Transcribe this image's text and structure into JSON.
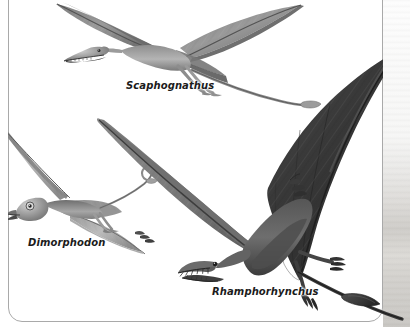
{
  "page": {
    "background_color": "#ffffff",
    "width": 410,
    "height": 327
  },
  "card": {
    "name": "illustration-card",
    "background_color": "#ffffff",
    "border_color": "#a9a9a9",
    "corner_radius_px": 14
  },
  "illustration": {
    "style": "grayscale pencil / airbrush paleoart",
    "subject": "three Jurassic rhamphorhynchoid pterosaurs in flight",
    "ink_colors": {
      "darkest": "#2b2b2b",
      "dark": "#4a4a4a",
      "mid": "#777777",
      "light": "#a8a8a8",
      "lightest": "#d5d5d5"
    },
    "figures": [
      {
        "id": "scaphognathus",
        "label": "Scaphognathus",
        "position": "upper center",
        "relative_size": "medium",
        "tone": "medium gray",
        "traits": "long narrow wings swept back, elongated tail with small diamond vane, slender toothy jaws"
      },
      {
        "id": "dimorphodon",
        "label": "Dimorphodon",
        "position": "left, lower middle",
        "relative_size": "small",
        "tone": "light gray",
        "traits": "deep puffin-like head, short broad skull, long thin tail with tip vane"
      },
      {
        "id": "rhamphorhynchus",
        "label": "Rhamphorhynchus",
        "position": "lower right, foreground",
        "relative_size": "large",
        "tone": "dark charcoal",
        "traits": "dark membranous wings, forward-pointing needle teeth, very long stiff tail with terminal diamond vane extending past the frame"
      }
    ]
  },
  "labels": {
    "scaphognathus": "Scaphognathus",
    "dimorphodon": "Dimorphodon",
    "rhamphorhynchus": "Rhamphorhynchus"
  }
}
